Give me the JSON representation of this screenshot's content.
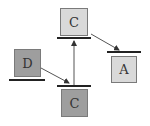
{
  "diagram": {
    "blocks": [
      {
        "id": "c_top",
        "label": "C",
        "color": "#d9d9d9"
      },
      {
        "id": "d",
        "label": "D",
        "color": "#9e9e9e"
      },
      {
        "id": "c_bottom",
        "label": "C",
        "color": "#9e9e9e"
      },
      {
        "id": "a",
        "label": "A",
        "color": "#d9d9d9"
      }
    ],
    "arrows": [
      {
        "from": "d",
        "to": "c_bottom-bar"
      },
      {
        "from": "c_bottom-bar",
        "to": "c_top-bar"
      },
      {
        "from": "c_top",
        "to": "a-bar"
      }
    ]
  }
}
